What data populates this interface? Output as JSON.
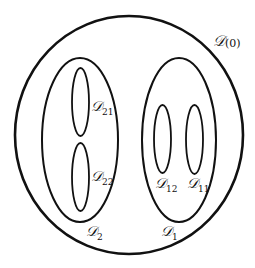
{
  "diagram": {
    "type": "nested-sets",
    "colors": {
      "stroke": "#111111",
      "background": "#ffffff"
    },
    "regions": [
      {
        "id": "D0",
        "letter": "D",
        "subscript": "(0)",
        "shape": "circle",
        "children": [
          "D1",
          "D2"
        ]
      },
      {
        "id": "D2",
        "letter": "D",
        "subscript": "2",
        "shape": "ellipse",
        "children": [
          "D21",
          "D22"
        ]
      },
      {
        "id": "D21",
        "letter": "D",
        "subscript": "21",
        "shape": "ellipse",
        "children": []
      },
      {
        "id": "D22",
        "letter": "D",
        "subscript": "22",
        "shape": "ellipse",
        "children": []
      },
      {
        "id": "D1",
        "letter": "D",
        "subscript": "1",
        "shape": "ellipse",
        "children": [
          "D12",
          "D11"
        ]
      },
      {
        "id": "D12",
        "letter": "D",
        "subscript": "12",
        "shape": "ellipse",
        "children": []
      },
      {
        "id": "D11",
        "letter": "D",
        "subscript": "11",
        "shape": "ellipse",
        "children": []
      }
    ],
    "labels": {
      "D0": {
        "letter": "𝒟",
        "sub": "(0)"
      },
      "D2": {
        "letter": "𝒟",
        "sub": "2"
      },
      "D21": {
        "letter": "𝒟",
        "sub": "21"
      },
      "D22": {
        "letter": "𝒟",
        "sub": "22"
      },
      "D1": {
        "letter": "𝒟",
        "sub": "1"
      },
      "D12": {
        "letter": "𝒟",
        "sub": "12"
      },
      "D11": {
        "letter": "𝒟",
        "sub": "11"
      }
    }
  }
}
